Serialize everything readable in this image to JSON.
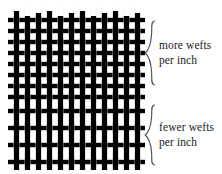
{
  "figure": {
    "colors": {
      "thread": "#000000",
      "background": "#ffffff",
      "text": "#1a1a1a",
      "brace": "#4a4a4a"
    },
    "weave": {
      "type": "plain-weave",
      "warp_count": 12,
      "warp_label": "warp (vertical threads)",
      "weft_label": "weft (horizontal threads)",
      "zones": [
        {
          "id": "dense",
          "name": "more wefts per inch",
          "weft_rows": 8,
          "weft_spacing_px": 11
        },
        {
          "id": "sparse",
          "name": "fewer wefts per inch",
          "weft_rows": 5,
          "weft_spacing_px": 17
        }
      ]
    }
  },
  "annotations": [
    {
      "id": "more",
      "brace_icon": "curly-brace-right",
      "lines": [
        "more wefts",
        "per inch"
      ],
      "line1": "more wefts",
      "line2": "per inch"
    },
    {
      "id": "fewer",
      "brace_icon": "curly-brace-right",
      "lines": [
        "fewer wefts",
        "per inch"
      ],
      "line1": "fewer wefts",
      "line2": "per inch"
    }
  ]
}
